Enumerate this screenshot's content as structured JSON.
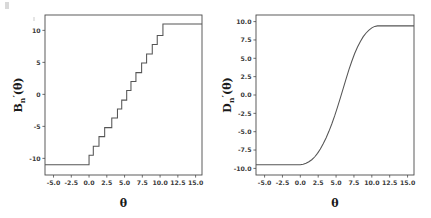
{
  "figure": {
    "background": "#ffffff",
    "line_color": "#555555",
    "axis_color": "#4a4a4a",
    "text_color": "#1a1a1a"
  },
  "chart_data": [
    {
      "type": "line",
      "panel": "left",
      "title": "",
      "xlabel": "θ",
      "ylabel_base": "B",
      "ylabel_sub": "n",
      "ylabel_prime": "′",
      "ylabel_arg": "(θ)",
      "ylabel": "Bₙ′(θ)",
      "grid": false,
      "legend": "none",
      "xlim": [
        -6.2,
        15.9
      ],
      "ylim": [
        -12.6,
        12.4
      ],
      "xticks": [
        -5.0,
        -2.5,
        0.0,
        2.5,
        5.0,
        7.5,
        10.0,
        12.5,
        15.0
      ],
      "xticklabels": [
        "-5.0",
        "-2.5",
        "0.0",
        "2.5",
        "5.0",
        "7.5",
        "10.0",
        "12.5",
        "15.0"
      ],
      "yticks": [
        -10,
        -5,
        0,
        5,
        10
      ],
      "yticklabels": [
        "-10",
        "-5",
        "0",
        "5",
        "10"
      ],
      "description": "Monotone non-decreasing right-continuous step function; saturates at -11 for theta below 0 and at +11 for theta above about 10.4",
      "step_points": [
        [
          -6.2,
          -11.0
        ],
        [
          0.0,
          -11.0
        ],
        [
          0.0,
          -9.5
        ],
        [
          0.6,
          -9.5
        ],
        [
          0.6,
          -8.1
        ],
        [
          1.4,
          -8.1
        ],
        [
          1.4,
          -6.6
        ],
        [
          2.2,
          -6.6
        ],
        [
          2.2,
          -5.2
        ],
        [
          3.2,
          -5.2
        ],
        [
          3.2,
          -3.7
        ],
        [
          4.0,
          -3.7
        ],
        [
          4.0,
          -2.3
        ],
        [
          4.6,
          -2.3
        ],
        [
          4.6,
          -0.9
        ],
        [
          5.3,
          -0.9
        ],
        [
          5.3,
          0.6
        ],
        [
          5.9,
          0.6
        ],
        [
          5.9,
          2.0
        ],
        [
          6.6,
          2.0
        ],
        [
          6.6,
          3.4
        ],
        [
          7.4,
          3.4
        ],
        [
          7.4,
          4.9
        ],
        [
          8.1,
          4.9
        ],
        [
          8.1,
          6.3
        ],
        [
          8.9,
          6.3
        ],
        [
          8.9,
          7.8
        ],
        [
          9.6,
          7.8
        ],
        [
          9.6,
          9.2
        ],
        [
          10.4,
          9.2
        ],
        [
          10.4,
          11.0
        ],
        [
          15.9,
          11.0
        ]
      ]
    },
    {
      "type": "line",
      "panel": "right",
      "title": "",
      "xlabel": "θ",
      "ylabel_base": "D",
      "ylabel_sub": "n",
      "ylabel_prime": "′",
      "ylabel_arg": "(θ)",
      "ylabel": "Dₙ′(θ)",
      "grid": false,
      "legend": "none",
      "xlim": [
        -6.2,
        15.9
      ],
      "ylim": [
        -10.9,
        10.9
      ],
      "xticks": [
        -5.0,
        -2.5,
        0.0,
        2.5,
        5.0,
        7.5,
        10.0,
        12.5,
        15.0
      ],
      "xticklabels": [
        "-5.0",
        "-2.5",
        "0.0",
        "2.5",
        "5.0",
        "7.5",
        "10.0",
        "12.5",
        "15.0"
      ],
      "yticks": [
        -10.0,
        -7.5,
        -5.0,
        -2.5,
        0.0,
        2.5,
        5.0,
        7.5,
        10.0
      ],
      "yticklabels": [
        "-10.0",
        "-7.5",
        "-5.0",
        "-2.5",
        "0.0",
        "2.5",
        "5.0",
        "7.5",
        "10.0"
      ],
      "description": "Smooth monotone sigmoid-like curve with fine staircase texture; flat at -9.5 for theta below 0, rises through 0 near theta = 5.2, saturates near +9.4 for theta above about 10.5",
      "curve_points": [
        [
          -6.2,
          -9.5
        ],
        [
          -5.0,
          -9.5
        ],
        [
          -3.0,
          -9.5
        ],
        [
          -1.0,
          -9.5
        ],
        [
          0.0,
          -9.5
        ],
        [
          0.4,
          -9.42
        ],
        [
          0.8,
          -9.3
        ],
        [
          1.2,
          -9.1
        ],
        [
          1.6,
          -8.82
        ],
        [
          2.0,
          -8.45
        ],
        [
          2.4,
          -7.95
        ],
        [
          2.8,
          -7.35
        ],
        [
          3.2,
          -6.65
        ],
        [
          3.6,
          -5.85
        ],
        [
          4.0,
          -4.95
        ],
        [
          4.4,
          -3.95
        ],
        [
          4.8,
          -2.85
        ],
        [
          5.2,
          -1.65
        ],
        [
          5.6,
          -0.4
        ],
        [
          6.0,
          0.9
        ],
        [
          6.4,
          2.2
        ],
        [
          6.8,
          3.45
        ],
        [
          7.2,
          4.6
        ],
        [
          7.6,
          5.65
        ],
        [
          8.0,
          6.55
        ],
        [
          8.4,
          7.3
        ],
        [
          8.8,
          7.95
        ],
        [
          9.2,
          8.45
        ],
        [
          9.6,
          8.85
        ],
        [
          10.0,
          9.15
        ],
        [
          10.4,
          9.35
        ],
        [
          10.8,
          9.42
        ],
        [
          12.0,
          9.42
        ],
        [
          13.5,
          9.42
        ],
        [
          15.9,
          9.42
        ]
      ]
    }
  ]
}
